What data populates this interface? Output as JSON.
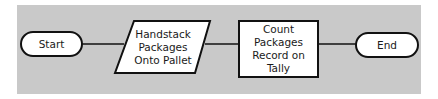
{
  "diagram": {
    "type": "flowchart",
    "background_color": "#c9c9c9",
    "nodes": [
      {
        "id": "start",
        "shape": "terminator",
        "label": "Start"
      },
      {
        "id": "handstack",
        "shape": "parallelogram",
        "lines": [
          "Handstack",
          "Packages",
          "Onto Pallet"
        ]
      },
      {
        "id": "count",
        "shape": "rectangle",
        "lines": [
          "Count",
          "Packages",
          "Record on",
          "Tally"
        ]
      },
      {
        "id": "end",
        "shape": "terminator",
        "label": "End"
      }
    ],
    "edges": [
      {
        "from": "start",
        "to": "handstack"
      },
      {
        "from": "handstack",
        "to": "count"
      },
      {
        "from": "count",
        "to": "end"
      }
    ]
  }
}
